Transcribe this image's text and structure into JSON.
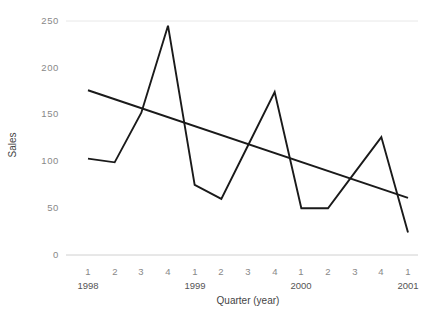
{
  "chart_data": {
    "type": "line",
    "title": "",
    "xlabel": "Quarter (year)",
    "ylabel": "Sales",
    "grid": false,
    "legend": "none",
    "ylim": [
      0,
      250
    ],
    "yticks": [
      0,
      50,
      100,
      150,
      200,
      250
    ],
    "ytick_labels": [
      "0",
      "50",
      "100",
      "150",
      "200",
      "250"
    ],
    "x": [
      "1",
      "2",
      "3",
      "4",
      "1",
      "2",
      "3",
      "4",
      "1",
      "2",
      "3",
      "4",
      "1"
    ],
    "xtick_labels": [
      "1",
      "2",
      "3",
      "4",
      "1",
      "2",
      "3",
      "4",
      "1",
      "2",
      "3",
      "4",
      "1"
    ],
    "x_year_labels": [
      {
        "index": 0,
        "label": "1998"
      },
      {
        "index": 4,
        "label": "1999"
      },
      {
        "index": 8,
        "label": "2000"
      },
      {
        "index": 12,
        "label": "2001"
      }
    ],
    "categories": [
      "1 1998",
      "2 1998",
      "3 1998",
      "4 1998",
      "1 1999",
      "2 1999",
      "3 1999",
      "4 1999",
      "1 2000",
      "2 2000",
      "3 2000",
      "4 2000",
      "1 2001"
    ],
    "series": [
      {
        "name": "Sales",
        "color": "#1a1a1a",
        "values": [
          103,
          99,
          152,
          245,
          75,
          60,
          117,
          174,
          50,
          50,
          88,
          126,
          24
        ]
      },
      {
        "name": "Trend",
        "type": "trend",
        "color": "#1a1a1a",
        "endpoints": [
          {
            "x": "1 1998",
            "y": 176
          },
          {
            "x": "1 2001",
            "y": 61
          }
        ]
      }
    ]
  }
}
